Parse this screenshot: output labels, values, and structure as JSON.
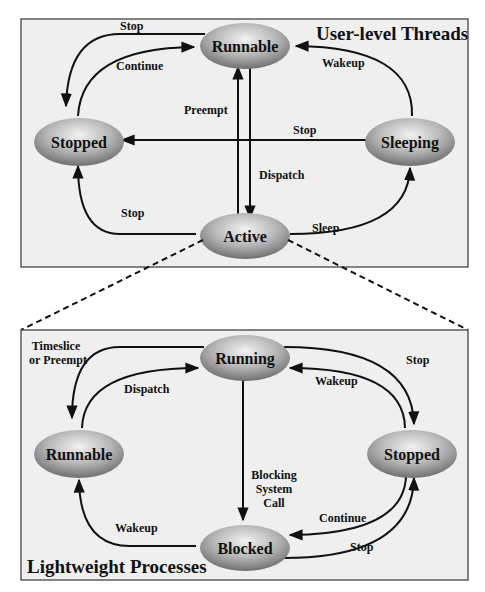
{
  "upper": {
    "title": "User-level Threads",
    "states": {
      "runnable": "Runnable",
      "stopped": "Stopped",
      "sleeping": "Sleeping",
      "active": "Active"
    },
    "transitions": {
      "runnable_to_stopped": "Stop",
      "stopped_to_runnable": "Continue",
      "sleeping_to_runnable": "Wakeup",
      "active_to_runnable": "Preempt",
      "sleeping_to_stopped": "Stop",
      "runnable_to_active": "Dispatch",
      "active_to_stopped": "Stop",
      "active_to_sleeping": "Sleep"
    }
  },
  "lower": {
    "title": "Lightweight Processes",
    "states": {
      "running": "Running",
      "runnable": "Runnable",
      "stopped": "Stopped",
      "blocked": "Blocked"
    },
    "transitions": {
      "running_to_runnable_1": "Timeslice",
      "running_to_runnable_2": "or Preempt",
      "runnable_to_running": "Dispatch",
      "running_to_stopped": "Stop",
      "stopped_to_running": "Wakeup",
      "running_to_blocked_1": "Blocking",
      "running_to_blocked_2": "System",
      "running_to_blocked_3": "Call",
      "blocked_to_runnable": "Wakeup",
      "stopped_to_blocked": "Continue",
      "blocked_to_stopped": "Stop"
    }
  },
  "colors": {
    "panel_bg": "#efefef",
    "node_dark": "#7a7a7a",
    "node_light": "#e6e6e6",
    "ink": "#111111"
  }
}
